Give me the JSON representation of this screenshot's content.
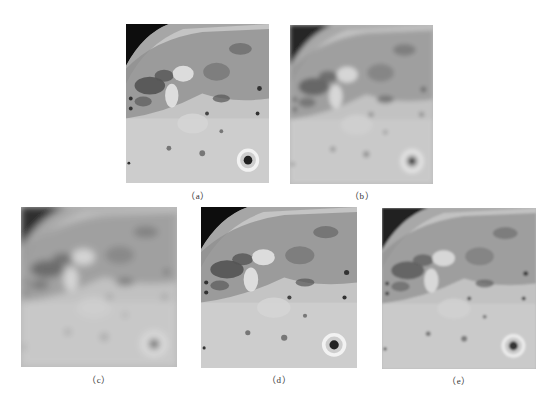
{
  "figure": {
    "panels": [
      {
        "id": "a",
        "label": "（a）",
        "description": "original satellite image of planetary surface (sharp)",
        "blur": 0.4,
        "contrast": 1.0
      },
      {
        "id": "b",
        "label": "（b）",
        "description": "blurred version",
        "blur": 2.2,
        "contrast": 0.85
      },
      {
        "id": "c",
        "label": "（c）",
        "description": "heavily blurred version",
        "blur": 3.6,
        "contrast": 0.8
      },
      {
        "id": "d",
        "label": "（d）",
        "description": "restored image",
        "blur": 0.7,
        "contrast": 1.05
      },
      {
        "id": "e",
        "label": "（e）",
        "description": "restored image (alternative method)",
        "blur": 0.9,
        "contrast": 0.9
      }
    ]
  }
}
